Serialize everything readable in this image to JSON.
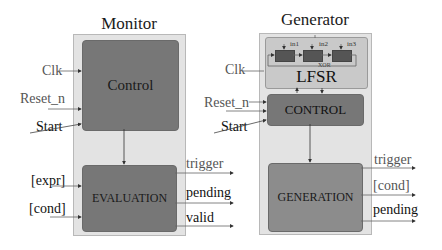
{
  "monitor": {
    "title": "Monitor",
    "control_label": "Control",
    "evaluation_label": "EVALUATION",
    "inputs": [
      "Clk",
      "Reset_n",
      "Start",
      "[expr]",
      "[cond]"
    ],
    "outputs": [
      "trigger",
      "pending",
      "valid"
    ]
  },
  "generator": {
    "title": "Generator",
    "lfsr": {
      "label": "LFSR",
      "taps": [
        "in1",
        "in2",
        "in3"
      ],
      "xor_label": "XOR"
    },
    "control_label": "CONTROL",
    "generation_label": "GENERATION",
    "inputs": [
      "Clk",
      "Reset_n",
      "Start"
    ],
    "outputs": [
      "trigger",
      "[cond]",
      "pending"
    ]
  },
  "colors": {
    "outer_bg": "#e3e3e3",
    "block_dark": "#777777",
    "block_gen": "#8c8c8c",
    "lfsr_bg": "#c9c9c9",
    "register": "#555555"
  }
}
